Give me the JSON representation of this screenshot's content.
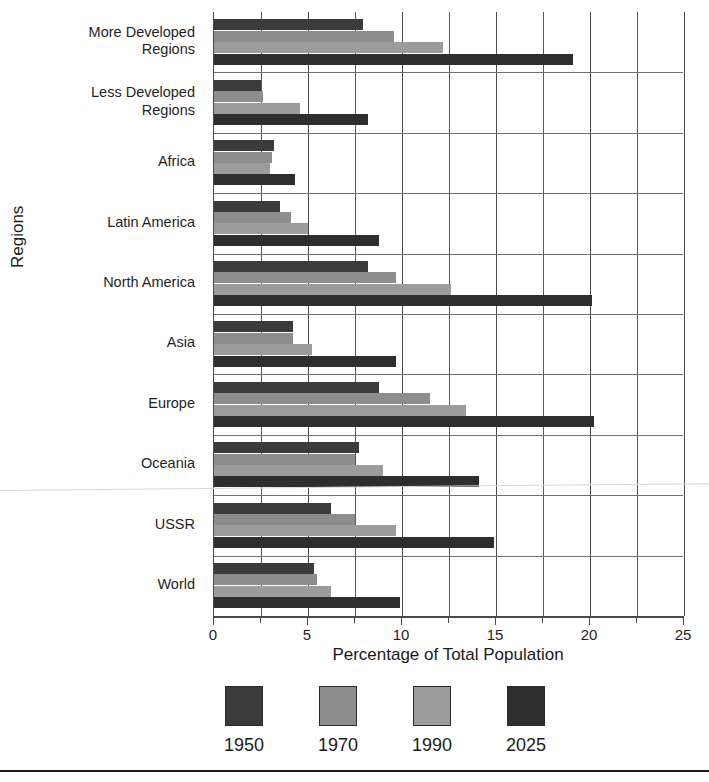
{
  "chart_data": {
    "type": "bar",
    "orientation": "horizontal",
    "title": "",
    "xlabel": "Percentage of Total Population",
    "ylabel": "Regions",
    "xlim": [
      0,
      25
    ],
    "xticks": [
      0,
      5,
      10,
      15,
      20,
      25
    ],
    "xtick_labels": [
      "0",
      "5",
      "10",
      "15",
      "20",
      "25"
    ],
    "minor_tick_step": 2.5,
    "grid": true,
    "legend_position": "bottom",
    "categories": [
      "More Developed\nRegions",
      "Less Developed\nRegions",
      "Africa",
      "Latin America",
      "North America",
      "Asia",
      "Europe",
      "Oceania",
      "USSR",
      "World"
    ],
    "series": [
      {
        "name": "1950",
        "color": "#3b3b3b",
        "values": [
          7.9,
          2.5,
          3.2,
          3.5,
          8.2,
          4.2,
          8.8,
          7.7,
          6.2,
          5.3
        ]
      },
      {
        "name": "1970",
        "color": "#8d8d8d",
        "values": [
          9.6,
          2.6,
          3.1,
          4.1,
          9.7,
          4.2,
          11.5,
          7.5,
          7.5,
          5.5
        ]
      },
      {
        "name": "1990",
        "color": "#9c9c9c",
        "values": [
          12.2,
          4.6,
          3.0,
          5.0,
          12.6,
          5.2,
          13.4,
          9.0,
          9.7,
          6.2
        ]
      },
      {
        "name": "2025",
        "color": "#2e2e2e",
        "values": [
          19.1,
          8.2,
          4.3,
          8.8,
          20.1,
          9.7,
          20.2,
          14.1,
          14.9,
          9.9
        ]
      }
    ]
  },
  "axis": {
    "x_title": "Percentage of Total Population",
    "y_title": "Regions"
  }
}
